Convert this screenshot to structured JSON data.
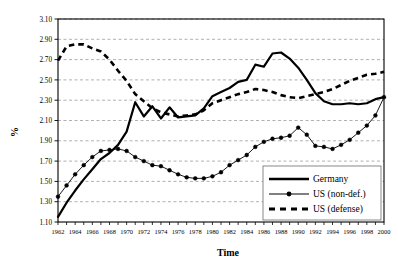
{
  "chart_data": {
    "type": "line",
    "title": "",
    "xlabel": "Time",
    "ylabel": "%",
    "xlim": [
      1962,
      2000
    ],
    "ylim": [
      1.1,
      3.1
    ],
    "ytick_step": 0.2,
    "grid": true,
    "grid_style": "dashed-horizontal",
    "legend_position": "bottom-right",
    "x": [
      1962,
      1963,
      1964,
      1965,
      1966,
      1967,
      1968,
      1969,
      1970,
      1971,
      1972,
      1973,
      1974,
      1975,
      1976,
      1977,
      1978,
      1979,
      1980,
      1981,
      1982,
      1983,
      1984,
      1985,
      1986,
      1987,
      1988,
      1989,
      1990,
      1991,
      1992,
      1993,
      1994,
      1995,
      1996,
      1997,
      1998,
      1999,
      2000
    ],
    "xticklabels": [
      "1962",
      "1964",
      "1966",
      "1968",
      "1970",
      "1972",
      "1974",
      "1976",
      "1978",
      "1980",
      "1982",
      "1984",
      "1986",
      "1988",
      "1990",
      "1992",
      "1994",
      "1996",
      "1998",
      "2000"
    ],
    "yticklabels": [
      "1.10",
      "1.30",
      "1.50",
      "1.70",
      "1.90",
      "2.10",
      "2.30",
      "2.50",
      "2.70",
      "2.90",
      "3.10"
    ],
    "series": [
      {
        "name": "Germany",
        "style": "solid",
        "marker": "none",
        "color": "#000000",
        "values": [
          1.15,
          1.29,
          1.41,
          1.52,
          1.62,
          1.72,
          1.78,
          1.86,
          1.99,
          2.28,
          2.14,
          2.24,
          2.12,
          2.23,
          2.13,
          2.14,
          2.15,
          2.22,
          2.34,
          2.38,
          2.42,
          2.48,
          2.5,
          2.65,
          2.63,
          2.76,
          2.77,
          2.71,
          2.62,
          2.5,
          2.37,
          2.29,
          2.26,
          2.26,
          2.27,
          2.26,
          2.27,
          2.31,
          2.33
        ]
      },
      {
        "name": "US (non-def.)",
        "style": "solid",
        "marker": "circle",
        "color": "#000000",
        "values": [
          1.35,
          1.46,
          1.57,
          1.66,
          1.74,
          1.8,
          1.81,
          1.82,
          1.8,
          1.74,
          1.7,
          1.66,
          1.65,
          1.61,
          1.57,
          1.54,
          1.53,
          1.53,
          1.55,
          1.59,
          1.66,
          1.71,
          1.76,
          1.84,
          1.89,
          1.92,
          1.93,
          1.95,
          2.03,
          1.96,
          1.85,
          1.84,
          1.82,
          1.86,
          1.91,
          1.98,
          2.05,
          2.15,
          2.33
        ]
      },
      {
        "name": "US (defense)",
        "style": "dashed",
        "marker": "none",
        "color": "#000000",
        "values": [
          2.69,
          2.83,
          2.85,
          2.85,
          2.81,
          2.78,
          2.7,
          2.59,
          2.49,
          2.36,
          2.29,
          2.22,
          2.18,
          2.16,
          2.14,
          2.15,
          2.16,
          2.2,
          2.27,
          2.3,
          2.33,
          2.36,
          2.38,
          2.41,
          2.4,
          2.38,
          2.35,
          2.33,
          2.32,
          2.34,
          2.36,
          2.38,
          2.41,
          2.45,
          2.49,
          2.52,
          2.55,
          2.56,
          2.58
        ]
      }
    ]
  },
  "legend": {
    "items": [
      {
        "label": "Germany"
      },
      {
        "label": "US (non-def.)"
      },
      {
        "label": "US (defense)"
      }
    ]
  },
  "axes": {
    "x_title": "Time",
    "y_title": "%"
  }
}
